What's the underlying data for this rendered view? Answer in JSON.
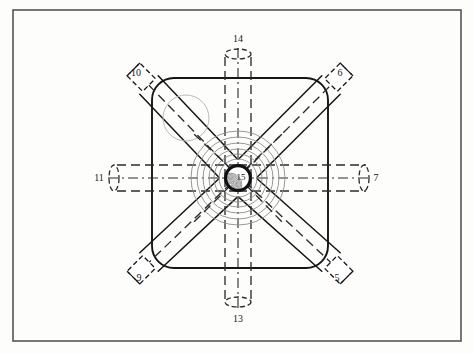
{
  "figure": {
    "domain": "Diagram",
    "canvas": {
      "width": 473,
      "height": 353
    },
    "background_color": "#fdfdfc",
    "frame": {
      "name": "figure-border",
      "x": 13,
      "y": 10,
      "width": 448,
      "height": 331,
      "stroke_color": "#555555",
      "stroke_width": 1.6
    },
    "body": {
      "name": "valve-body",
      "x": 152,
      "y": 78,
      "width": 176,
      "height": 190,
      "corner_radius": 22,
      "stroke_color": "#151515",
      "stroke_width": 1.9,
      "fill": "none"
    },
    "hub": {
      "center_x": 238,
      "center_y": 178,
      "outer_radius": 14,
      "inner_radius": 11.5,
      "ring_color": "#111111",
      "ring_width": 3.2,
      "label": "15",
      "label_x": 241,
      "label_y": 180,
      "hatch_color": "#6a6a6a"
    },
    "concentric_rings": {
      "name": "concentric-seat-rings",
      "center_x": 238,
      "center_y": 178,
      "radii": [
        19,
        24,
        29,
        35,
        41,
        47
      ],
      "stroke_color": "#8c8c8c",
      "stroke_width": 0.9
    },
    "ghost_circle": {
      "name": "ghost-bore-circle",
      "center_x": 186,
      "center_y": 118,
      "radius": 23,
      "stroke_color": "#b9b9b9",
      "stroke_width": 1.0
    },
    "colors": {
      "ink": "#151515",
      "frame": "#555555",
      "dashed": "#2b2b2b",
      "faint": "#8c8c8c",
      "ghost": "#b9b9b9",
      "paper": "#fdfdfc"
    }
  },
  "ports": [
    {
      "id": "port-6",
      "label": "6",
      "orientation": "diagonal",
      "direction": "top-right",
      "angle_deg": -45,
      "label_x": 340,
      "label_y": 76,
      "stub": {
        "cx": 331,
        "cy": 85,
        "length": 22,
        "half_width": 9
      },
      "channel_half_width": 13,
      "line_style": "solid-walls-dashed-center"
    },
    {
      "id": "port-10",
      "label": "10",
      "orientation": "diagonal",
      "direction": "top-left",
      "angle_deg": -135,
      "label_x": 136,
      "label_y": 76,
      "stub": {
        "cx": 149,
        "cy": 85,
        "length": 22,
        "half_width": 9
      },
      "channel_half_width": 13,
      "line_style": "solid-walls-dashed-center"
    },
    {
      "id": "port-9",
      "label": "9",
      "orientation": "diagonal",
      "direction": "bottom-left",
      "angle_deg": 135,
      "label_x": 139,
      "label_y": 281,
      "stub": {
        "cx": 149,
        "cy": 262,
        "length": 22,
        "half_width": 9
      },
      "channel_half_width": 13,
      "line_style": "solid-walls-dashed-center"
    },
    {
      "id": "port-5",
      "label": "5",
      "orientation": "diagonal",
      "direction": "bottom-right",
      "angle_deg": 45,
      "label_x": 337,
      "label_y": 281,
      "stub": {
        "cx": 331,
        "cy": 262,
        "length": 22,
        "half_width": 9
      },
      "channel_half_width": 13,
      "line_style": "solid-walls-dashed-center"
    },
    {
      "id": "port-7",
      "label": "7",
      "orientation": "horizontal",
      "direction": "right",
      "label_x": 376,
      "label_y": 181,
      "channel": {
        "x1": 238,
        "x2": 366,
        "half_width": 13
      },
      "end_cap": {
        "cx": 364,
        "cy": 178,
        "rx": 5,
        "ry": 13
      },
      "line_style": "dashed"
    },
    {
      "id": "port-11",
      "label": "11",
      "orientation": "horizontal",
      "direction": "left",
      "label_x": 99,
      "label_y": 181,
      "channel": {
        "x1": 238,
        "x2": 112,
        "half_width": 13
      },
      "end_cap": {
        "cx": 114,
        "cy": 178,
        "rx": 5,
        "ry": 13
      },
      "line_style": "dashed"
    },
    {
      "id": "port-14",
      "label": "14",
      "orientation": "vertical",
      "direction": "top",
      "label_x": 238,
      "label_y": 42,
      "channel": {
        "y1": 178,
        "y2": 52,
        "half_width": 13
      },
      "end_cap": {
        "cx": 238,
        "cy": 54,
        "rx": 13,
        "ry": 5
      },
      "line_style": "dashed"
    },
    {
      "id": "port-13",
      "label": "13",
      "orientation": "vertical",
      "direction": "bottom",
      "label_x": 238,
      "label_y": 322,
      "channel": {
        "y1": 178,
        "y2": 304,
        "half_width": 13
      },
      "end_cap": {
        "cx": 238,
        "cy": 302,
        "rx": 13,
        "ry": 5
      },
      "line_style": "dashed"
    }
  ]
}
